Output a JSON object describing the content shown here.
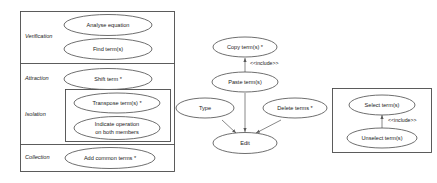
{
  "diagram": {
    "type": "uml-use-case-diagram",
    "background_color": "#ffffff",
    "stroke_color": "#4a4a4a",
    "text_color": "#1a1a1a"
  },
  "left_package": {
    "rows": [
      {
        "label": "Verification",
        "use_cases": [
          {
            "name": "Analyse equation"
          },
          {
            "name": "Find term(s)"
          }
        ]
      },
      {
        "label": "Attraction",
        "use_cases": [
          {
            "name": "Shift term *"
          }
        ]
      },
      {
        "label": "Isolation",
        "use_cases": [
          {
            "name": "Transpose term(s) *"
          },
          {
            "name": "Indicate operation",
            "name_line2": "on both members"
          }
        ]
      },
      {
        "label": "Collection",
        "use_cases": [
          {
            "name": "Add common terms *"
          }
        ]
      }
    ]
  },
  "middle_cluster": {
    "use_cases": [
      {
        "id": "copy",
        "name": "Copy term(s) *"
      },
      {
        "id": "paste",
        "name": "Paste term(s)"
      },
      {
        "id": "type",
        "name": "Type"
      },
      {
        "id": "delete",
        "name": "Delete terms *"
      },
      {
        "id": "edit",
        "name": "Edit"
      }
    ],
    "relationships": [
      {
        "from": "copy",
        "to": "paste",
        "stereotype": "<<include>>"
      },
      {
        "from": "paste",
        "to": "edit",
        "stereotype": ""
      },
      {
        "from": "type",
        "to": "edit",
        "stereotype": ""
      },
      {
        "from": "delete",
        "to": "edit",
        "stereotype": ""
      }
    ]
  },
  "right_package": {
    "use_cases": [
      {
        "id": "select",
        "name": "Select term(s)"
      },
      {
        "id": "unselect",
        "name": "Unselect term(s)"
      }
    ],
    "relationships": [
      {
        "from": "select",
        "to": "unselect",
        "stereotype": "<<include>>"
      }
    ]
  }
}
